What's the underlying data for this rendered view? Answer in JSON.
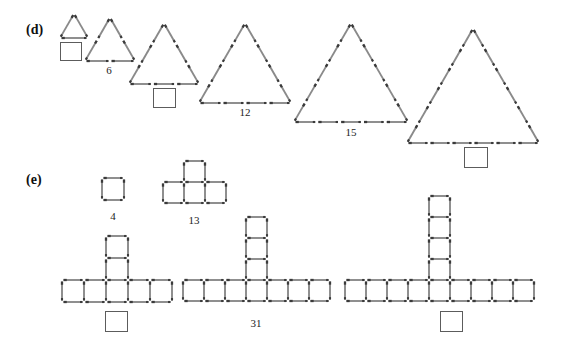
{
  "page": {
    "width": 569,
    "height": 352,
    "background": "#ffffff",
    "stick_color": "#8a8a8a",
    "stick_head_color": "#3a3a3a",
    "box_border_color": "#5c5c5c"
  },
  "sections": [
    {
      "id": "d",
      "label": "(d)",
      "label_x": 26,
      "label_y": 22,
      "pattern_type": "triangle-of-matchsticks",
      "figures": [
        {
          "name": "triangle-figure-1",
          "rows": 1,
          "matches": 3,
          "label": "",
          "has_answer_box": true,
          "answer_box": {
            "x": 60,
            "y": 42,
            "w": 22,
            "h": 19
          },
          "apex_x": 74,
          "base_y": 38,
          "side": 28
        },
        {
          "name": "triangle-figure-2",
          "rows": 2,
          "matches": 6,
          "label": "6",
          "has_answer_box": false,
          "label_x": 109,
          "label_y": 64,
          "apex_x": 110,
          "base_y": 61,
          "side": 50
        },
        {
          "name": "triangle-figure-3",
          "rows": 3,
          "matches": 9,
          "label": "",
          "has_answer_box": true,
          "answer_box": {
            "x": 153,
            "y": 88,
            "w": 23,
            "h": 20
          },
          "apex_x": 164,
          "base_y": 84,
          "side": 70
        },
        {
          "name": "triangle-figure-4",
          "rows": 4,
          "matches": 12,
          "label": "12",
          "has_answer_box": false,
          "label_x": 245,
          "label_y": 106,
          "apex_x": 245,
          "base_y": 103,
          "side": 92
        },
        {
          "name": "triangle-figure-5",
          "rows": 5,
          "matches": 15,
          "label": "15",
          "has_answer_box": false,
          "label_x": 351,
          "label_y": 126,
          "apex_x": 351,
          "base_y": 122,
          "side": 114
        },
        {
          "name": "triangle-figure-6",
          "rows": 6,
          "matches": 18,
          "label": "",
          "has_answer_box": true,
          "answer_box": {
            "x": 464,
            "y": 147,
            "w": 24,
            "h": 21
          },
          "apex_x": 473,
          "base_y": 143,
          "side": 132
        }
      ]
    },
    {
      "id": "e",
      "label": "(e)",
      "label_x": 26,
      "label_y": 172,
      "pattern_type": "squares-cross-of-matchsticks",
      "figures": [
        {
          "name": "squares-figure-1",
          "arm_squares": 1,
          "stem_squares": 0,
          "matches": 4,
          "label": "4",
          "has_answer_box": false,
          "label_x": 113,
          "label_y": 210,
          "cell": 22,
          "row_left": 102,
          "row_top": 178,
          "stem_index": 0
        },
        {
          "name": "squares-figure-2",
          "arm_squares": 3,
          "stem_squares": 1,
          "matches": 13,
          "label": "13",
          "has_answer_box": false,
          "label_x": 194,
          "label_y": 214,
          "cell": 21,
          "row_left": 163,
          "row_top": 182,
          "stem_index": 1
        },
        {
          "name": "squares-figure-3",
          "arm_squares": 5,
          "stem_squares": 2,
          "matches": 22,
          "label": "",
          "has_answer_box": true,
          "answer_box": {
            "x": 105,
            "y": 311,
            "w": 23,
            "h": 21
          },
          "cell": 22,
          "row_left": 62,
          "row_top": 280,
          "stem_index": 2
        },
        {
          "name": "squares-figure-4",
          "arm_squares": 7,
          "stem_squares": 3,
          "matches": 31,
          "label": "31",
          "has_answer_box": false,
          "label_x": 256,
          "label_y": 317,
          "cell": 21,
          "row_left": 183,
          "row_top": 280,
          "stem_index": 3
        },
        {
          "name": "squares-figure-5",
          "arm_squares": 9,
          "stem_squares": 4,
          "matches": 40,
          "label": "",
          "has_answer_box": true,
          "answer_box": {
            "x": 440,
            "y": 311,
            "w": 23,
            "h": 21
          },
          "cell": 21,
          "row_left": 345,
          "row_top": 280,
          "stem_index": 4
        }
      ]
    }
  ]
}
